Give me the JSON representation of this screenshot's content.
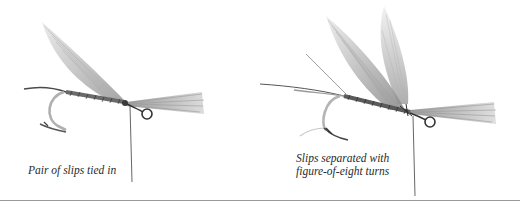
{
  "figure": {
    "panels": [
      {
        "id": "left",
        "caption": "Pair of slips tied in",
        "state": "wing slips tied in together"
      },
      {
        "id": "right",
        "caption_lines": [
          "Slips separated with",
          "figure-of-eight turns"
        ],
        "state": "wing slips separated"
      }
    ],
    "colors": {
      "background": "#ffffff",
      "thread": "#3a3a3a",
      "feather": "#b8b8b8",
      "hook": "#555555",
      "divider": "#9a9a9a"
    }
  }
}
